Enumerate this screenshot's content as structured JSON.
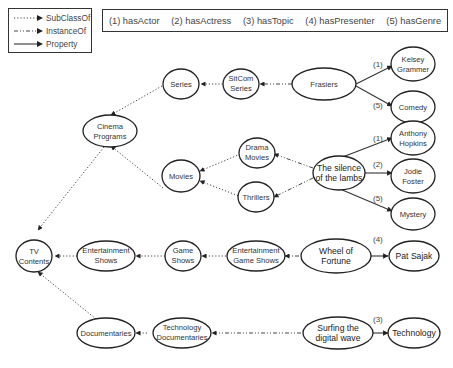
{
  "legend": {
    "items": [
      {
        "label": "SubClassOf",
        "style": "dotted"
      },
      {
        "label": "InstanceOf",
        "style": "dash-dot"
      },
      {
        "label": "Property",
        "style": "solid"
      }
    ]
  },
  "properties": [
    {
      "label": "(1) hasActor"
    },
    {
      "label": "(2) hasActress"
    },
    {
      "label": "(3) hasTopic"
    },
    {
      "label": "(4) hasPresenter"
    },
    {
      "label": "(5) hasGenre"
    }
  ],
  "nodes": {
    "tv_contents": [
      "TV",
      "Contents"
    ],
    "cinema_programs": [
      "Cinema",
      "Programs"
    ],
    "series": [
      "Series"
    ],
    "sitcom_series": [
      "SitCom",
      "Series"
    ],
    "frasiers": [
      "Frasiers"
    ],
    "kelsey": [
      "Kelsey",
      "Grammer"
    ],
    "comedy": [
      "Comedy"
    ],
    "movies": [
      "Movies"
    ],
    "drama_movies": [
      "Drama",
      "Movies"
    ],
    "thrillers": [
      "Thrillers"
    ],
    "silence": [
      "The silence",
      "of the lambs"
    ],
    "anthony": [
      "Anthony",
      "Hopkins"
    ],
    "jodie": [
      "Jodie",
      "Foster"
    ],
    "mystery": [
      "Mystery"
    ],
    "entertainment_shows": [
      "Entertainment",
      "Shows"
    ],
    "game_shows": [
      "Game",
      "Shows"
    ],
    "ent_game_shows": [
      "Entertainment",
      "Game Shows"
    ],
    "wheel": [
      "Wheel of",
      "Fortune"
    ],
    "pat": [
      "Pat Sajak"
    ],
    "documentaries": [
      "Documentaries"
    ],
    "tech_docs": [
      "Technology",
      "Documentaries"
    ],
    "surfing": [
      "Surfing the",
      "digital wave"
    ],
    "technology": [
      "Technology"
    ]
  },
  "edge_labels": {
    "frasiers_kelsey": "(1)",
    "frasiers_comedy": "(5)",
    "silence_anthony": "(1)",
    "silence_jodie": "(2)",
    "silence_mystery": "(5)",
    "wheel_pat": "(4)",
    "surfing_technology": "(3)"
  }
}
